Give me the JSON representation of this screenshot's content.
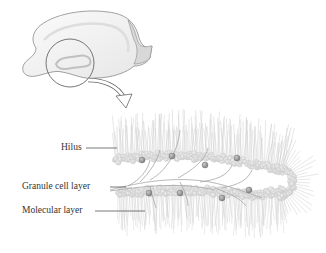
{
  "figure": {
    "labels": [
      {
        "id": "hilus",
        "text": "Hilus"
      },
      {
        "id": "granule",
        "text": "Granule cell layer"
      },
      {
        "id": "molecular",
        "text": "Molecular layer"
      }
    ],
    "colors": {
      "background": "#ffffff",
      "outline": "#6b6b6b",
      "brain_fill": "#f2f2f2",
      "cells": "#d9d9d9",
      "soma": "#9a9a9a",
      "dendrites": "#c4c4c4",
      "label_text": "#333333"
    }
  }
}
